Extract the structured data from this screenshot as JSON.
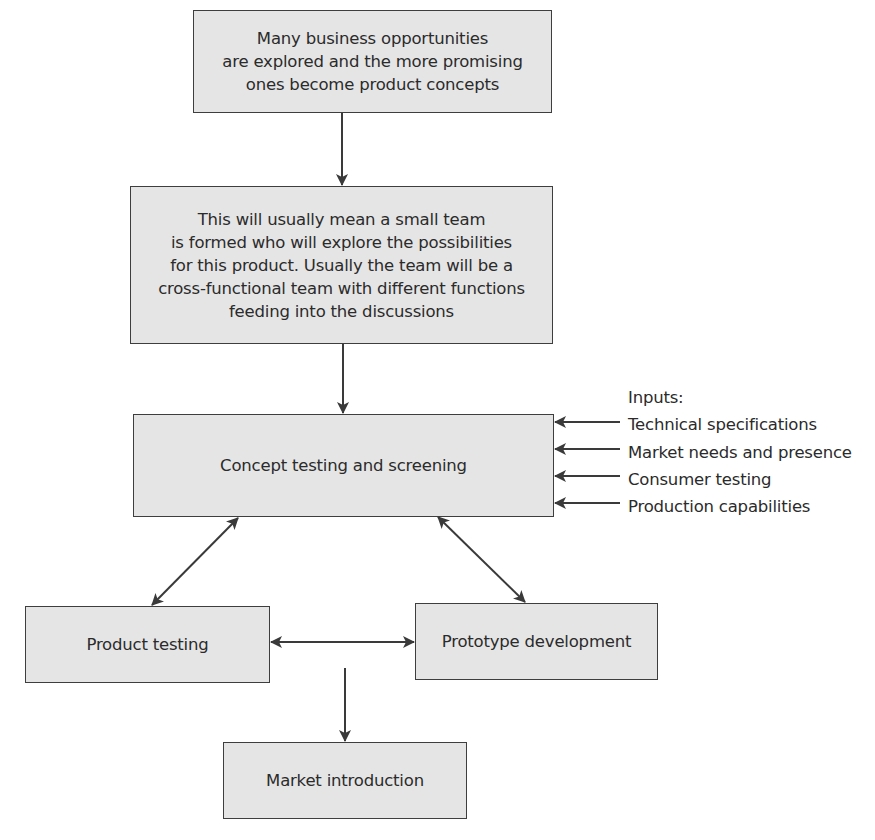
{
  "diagram": {
    "type": "flowchart",
    "nodes": {
      "opportunities": {
        "text": "Many business opportunities\nare explored and the more promising\nones become product concepts"
      },
      "team": {
        "text": "This will usually mean a small team\nis formed who will explore the possibilities\nfor this product. Usually the team will be a\ncross-functional team with different functions\nfeeding into the discussions"
      },
      "concept_testing": {
        "text": "Concept testing and screening"
      },
      "product_testing": {
        "text": "Product testing"
      },
      "prototype": {
        "text": "Prototype development"
      },
      "market_intro": {
        "text": "Market introduction"
      }
    },
    "inputs": {
      "heading": "Inputs:",
      "items": [
        "Technical specifications",
        "Market needs and presence",
        "Consumer testing",
        "Production capabilities"
      ]
    },
    "edges": [
      {
        "from": "opportunities",
        "to": "team",
        "direction": "one-way"
      },
      {
        "from": "team",
        "to": "concept_testing",
        "direction": "one-way"
      },
      {
        "from": "inputs",
        "to": "concept_testing",
        "direction": "one-way"
      },
      {
        "from": "concept_testing",
        "to": "product_testing",
        "direction": "two-way"
      },
      {
        "from": "concept_testing",
        "to": "prototype",
        "direction": "two-way"
      },
      {
        "from": "product_testing",
        "to": "prototype",
        "direction": "two-way"
      },
      {
        "from": "product_testing/prototype",
        "to": "market_intro",
        "direction": "one-way"
      }
    ],
    "colors": {
      "box_fill": "#e5e5e5",
      "box_border": "#3e3e3e",
      "line": "#3a3a3a",
      "text": "#2b2b2b"
    }
  }
}
